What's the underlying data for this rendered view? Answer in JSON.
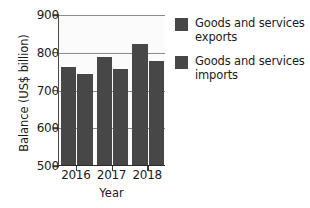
{
  "chart_data": {
    "type": "bar",
    "title": "",
    "xlabel": "Year",
    "ylabel": "Balance (US$ billion)",
    "categories": [
      "2016",
      "2017",
      "2018"
    ],
    "series": [
      {
        "name": "Goods and services exports",
        "color": "#474747",
        "values": [
          760,
          785,
          820
        ]
      },
      {
        "name": "Goods and services imports",
        "color": "#474747",
        "values": [
          740,
          755,
          775
        ]
      }
    ],
    "ylim": [
      500,
      900
    ],
    "yticks": [
      500,
      600,
      700,
      800,
      900
    ],
    "ytick_labels": [
      "500",
      "600",
      "700",
      "800",
      "900"
    ],
    "grid": true,
    "legend_position": "right"
  },
  "legend": {
    "entries": [
      {
        "label_line1": "Goods and services",
        "label_line2": "exports"
      },
      {
        "label_line1": "Goods and services",
        "label_line2": "imports"
      }
    ]
  },
  "colors": {
    "bar": "#474747",
    "gridline": "#8c8c8c",
    "axis": "#2a2a2a",
    "text": "#1b1b1b",
    "plot_background": "#fbfbfb",
    "page_background": "#ffffff"
  }
}
